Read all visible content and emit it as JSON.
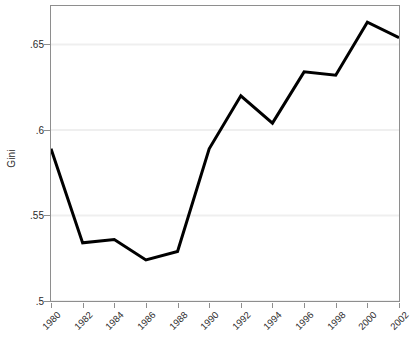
{
  "chart_data": {
    "type": "line",
    "title": "",
    "subtitle": "",
    "xlabel": "",
    "ylabel": "Gini",
    "x": [
      1980,
      1982,
      1984,
      1986,
      1988,
      1990,
      1992,
      1994,
      1996,
      1998,
      2000,
      2002
    ],
    "categories": [
      "1980",
      "1982",
      "1984",
      "1986",
      "1988",
      "1990",
      "1992",
      "1994",
      "1996",
      "1998",
      "2000",
      "2002"
    ],
    "values": [
      0.589,
      0.534,
      0.536,
      0.524,
      0.529,
      0.589,
      0.62,
      0.604,
      0.634,
      0.632,
      0.663,
      0.654
    ],
    "series": [
      {
        "name": "Gini",
        "values": [
          0.589,
          0.534,
          0.536,
          0.524,
          0.529,
          0.589,
          0.62,
          0.604,
          0.634,
          0.632,
          0.663,
          0.654
        ],
        "color": "#000000",
        "line_width": 3
      }
    ],
    "xlim": [
      1980,
      2002
    ],
    "ylim": [
      0.5,
      0.6725
    ],
    "ytick_values": [
      0.5,
      0.55,
      0.6,
      0.65
    ],
    "ytick_labels": [
      ".5",
      ".55",
      ".6",
      ".65"
    ],
    "xtick_labels": [
      "1980",
      "1982",
      "1984",
      "1986",
      "1988",
      "1990",
      "1992",
      "1994",
      "1996",
      "1998",
      "2000",
      "2002"
    ],
    "xtick_rotation": -45,
    "grid": {
      "horizontal": true,
      "vertical": false,
      "color": "#efefef"
    },
    "legend": null,
    "annotations": [],
    "frame_color": "#8e8e8e",
    "background": "#ffffff"
  }
}
